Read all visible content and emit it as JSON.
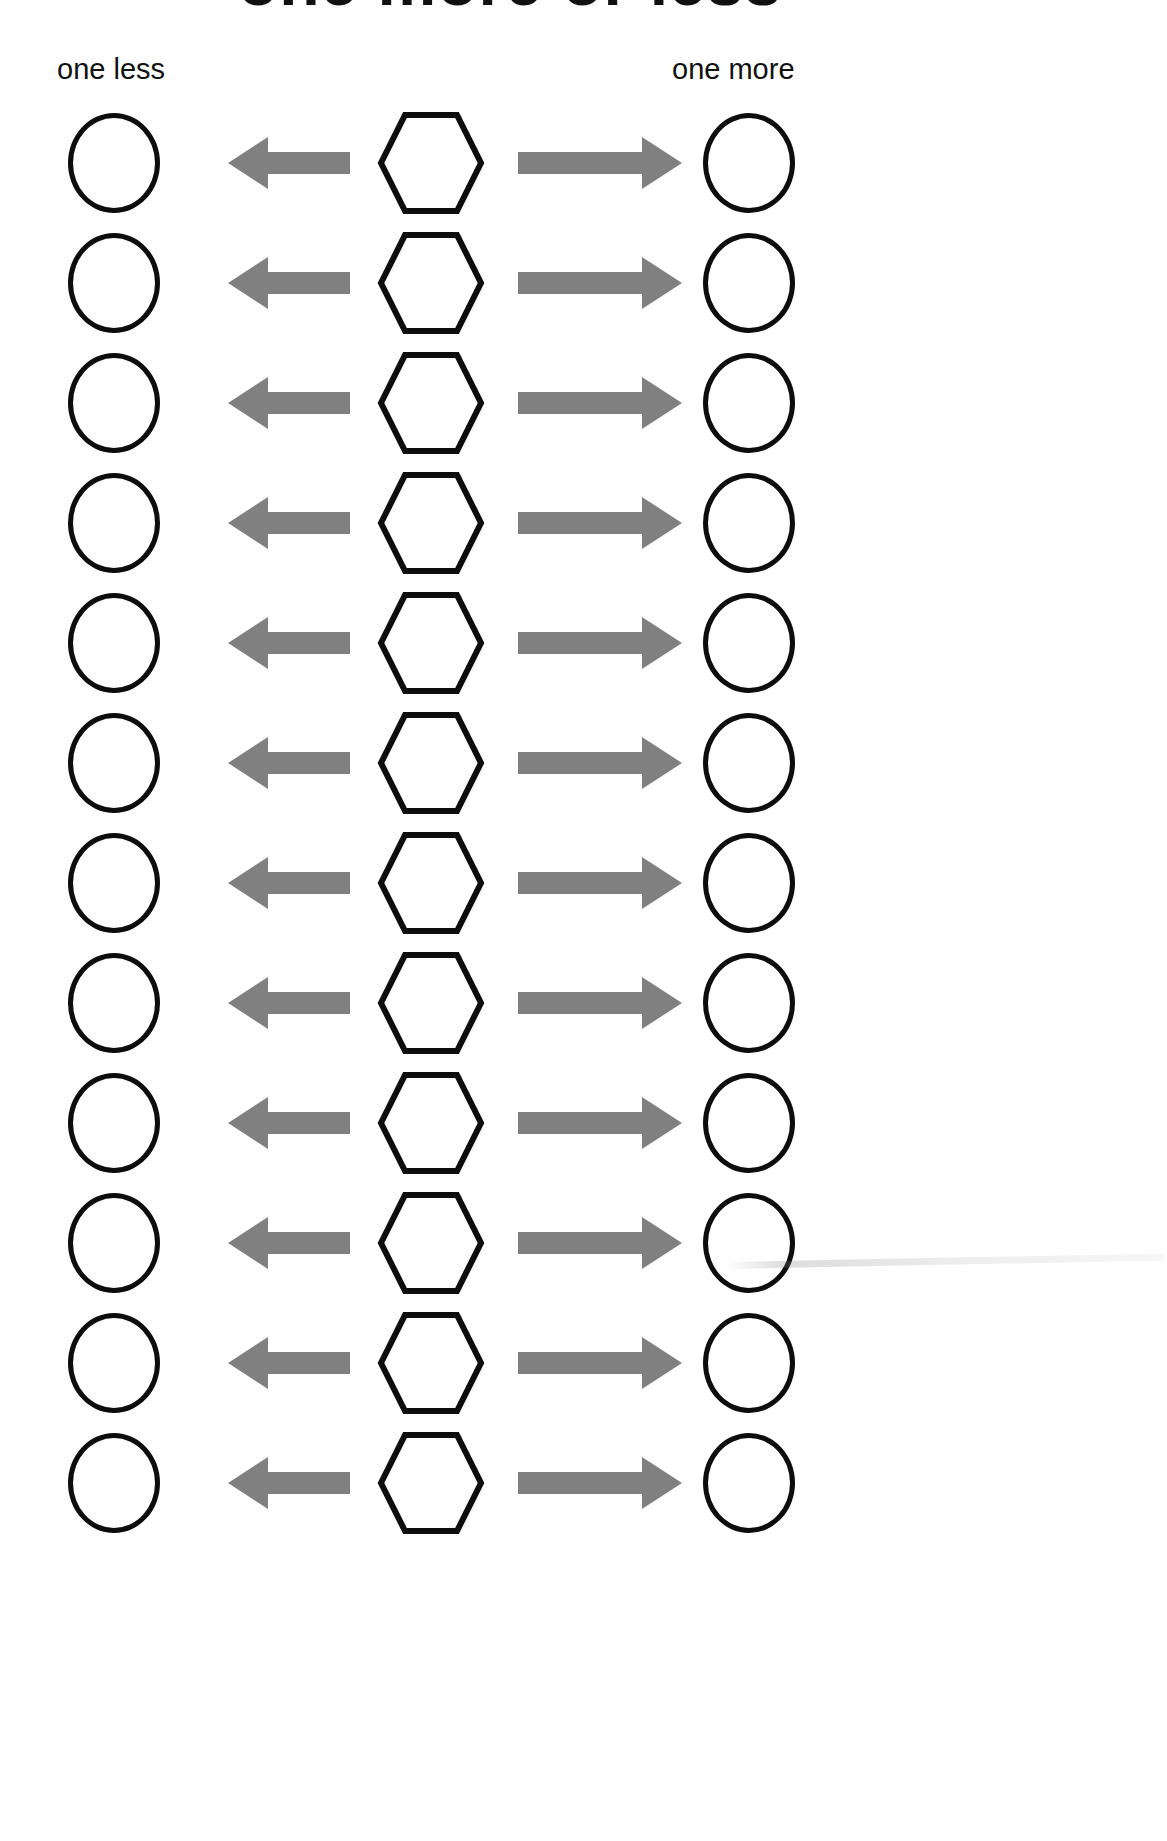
{
  "document": {
    "title": "one more or less",
    "type": "math worksheet",
    "page_width": 1167,
    "page_height": 1841,
    "background_color": "#ffffff",
    "ink_color": "#0d0d0d",
    "arrow_color": "#808080"
  },
  "headers": {
    "left_label": "one less",
    "right_label": "one more"
  },
  "layout": {
    "row_count": 12,
    "first_row_top": 105,
    "row_pitch": 120,
    "columns": [
      {
        "name": "answer-circle-left",
        "x": 68,
        "width": 92,
        "shape": "circle"
      },
      {
        "name": "arrow-left",
        "x": 228,
        "width": 122,
        "shape": "arrow-left"
      },
      {
        "name": "number-hexagon",
        "x": 375,
        "width": 112,
        "shape": "hexagon"
      },
      {
        "name": "arrow-right",
        "x": 518,
        "width": 164,
        "shape": "arrow-right"
      },
      {
        "name": "answer-circle-right",
        "x": 703,
        "width": 92,
        "shape": "circle"
      }
    ]
  },
  "rows": [
    {
      "index": 1,
      "circle_left": "",
      "hexagon": "",
      "circle_right": ""
    },
    {
      "index": 2,
      "circle_left": "",
      "hexagon": "",
      "circle_right": ""
    },
    {
      "index": 3,
      "circle_left": "",
      "hexagon": "",
      "circle_right": ""
    },
    {
      "index": 4,
      "circle_left": "",
      "hexagon": "",
      "circle_right": ""
    },
    {
      "index": 5,
      "circle_left": "",
      "hexagon": "",
      "circle_right": ""
    },
    {
      "index": 6,
      "circle_left": "",
      "hexagon": "",
      "circle_right": ""
    },
    {
      "index": 7,
      "circle_left": "",
      "hexagon": "",
      "circle_right": ""
    },
    {
      "index": 8,
      "circle_left": "",
      "hexagon": "",
      "circle_right": ""
    },
    {
      "index": 9,
      "circle_left": "",
      "hexagon": "",
      "circle_right": ""
    },
    {
      "index": 10,
      "circle_left": "",
      "hexagon": "",
      "circle_right": ""
    },
    {
      "index": 11,
      "circle_left": "",
      "hexagon": "",
      "circle_right": ""
    },
    {
      "index": 12,
      "circle_left": "",
      "hexagon": "",
      "circle_right": ""
    }
  ],
  "icons": {
    "arrow_left": "arrow-left-icon",
    "arrow_right": "arrow-right-icon",
    "hexagon": "hexagon-icon",
    "circle": "circle-icon"
  }
}
